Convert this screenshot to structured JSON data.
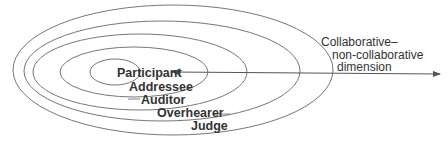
{
  "diagram": {
    "type": "nested-ellipses",
    "roles": [
      {
        "label": "Participant"
      },
      {
        "label": "Addressee"
      },
      {
        "label": "Auditor"
      },
      {
        "label": "Overhearer"
      },
      {
        "label": "Judge"
      }
    ],
    "axis": {
      "label_line1": "Collaborative–",
      "label_line2": "non-collaborative",
      "label_line3": "dimension"
    },
    "colors": {
      "line": "#555555",
      "text": "#333333",
      "background": "#ffffff"
    }
  }
}
